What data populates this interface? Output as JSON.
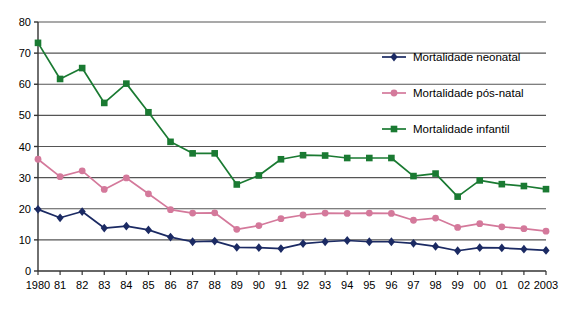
{
  "chart_data": {
    "type": "line",
    "title": "",
    "subtitle": "",
    "xlabel": "",
    "ylabel": "",
    "xlim": [
      1980,
      2003
    ],
    "ylim": [
      0,
      80
    ],
    "y_ticks": [
      0,
      10,
      20,
      30,
      40,
      50,
      60,
      70,
      80
    ],
    "grid": "horizontal",
    "legend_position": "top-right-inside",
    "x": [
      1980,
      1981,
      1982,
      1983,
      1984,
      1985,
      1986,
      1987,
      1988,
      1989,
      1990,
      1991,
      1992,
      1993,
      1994,
      1995,
      1996,
      1997,
      1998,
      1999,
      2000,
      2001,
      2002,
      2003
    ],
    "categories": [
      "1980",
      "81",
      "82",
      "83",
      "84",
      "85",
      "86",
      "87",
      "88",
      "89",
      "90",
      "91",
      "92",
      "93",
      "94",
      "95",
      "96",
      "97",
      "98",
      "99",
      "00",
      "01",
      "02",
      "2003"
    ],
    "series": [
      {
        "name": "Mortalidade neonatal",
        "color": "#1b2a63",
        "marker": "diamond",
        "values": [
          19.8,
          17.1,
          19.1,
          13.8,
          14.4,
          13.2,
          10.9,
          9.4,
          9.6,
          7.6,
          7.5,
          7.2,
          8.8,
          9.4,
          9.8,
          9.4,
          9.4,
          8.9,
          7.9,
          6.5,
          7.5,
          7.4,
          7.0,
          6.6
        ]
      },
      {
        "name": "Mortalidade pós-natal",
        "color": "#d4799b",
        "marker": "circle",
        "values": [
          35.9,
          30.3,
          32.2,
          26.2,
          29.9,
          24.8,
          19.7,
          18.6,
          18.7,
          13.4,
          14.6,
          16.8,
          18.0,
          18.6,
          18.5,
          18.6,
          18.5,
          16.3,
          17.0,
          14.0,
          15.2,
          14.2,
          13.6,
          12.8
        ]
      },
      {
        "name": "Mortalidade infantil",
        "color": "#1a7a32",
        "marker": "square",
        "values": [
          73.3,
          61.7,
          65.2,
          54.0,
          60.2,
          51.0,
          41.5,
          37.8,
          37.8,
          27.8,
          30.7,
          35.9,
          37.2,
          37.1,
          36.3,
          36.3,
          36.3,
          30.5,
          31.3,
          23.9,
          29.1,
          27.9,
          27.3,
          26.3
        ]
      }
    ]
  },
  "axes": {
    "y_tick_labels": [
      "80",
      "70",
      "60",
      "50",
      "40",
      "30",
      "20",
      "10",
      "0"
    ],
    "x_tick_labels": [
      "1980",
      "81",
      "82",
      "83",
      "84",
      "85",
      "86",
      "87",
      "88",
      "89",
      "90",
      "91",
      "92",
      "93",
      "94",
      "95",
      "96",
      "97",
      "98",
      "99",
      "00",
      "01",
      "02",
      "2003"
    ]
  },
  "legend": {
    "items": [
      {
        "label": "Mortalidade neonatal",
        "color": "#1b2a63",
        "marker": "diamond"
      },
      {
        "label": "Mortalidade pós-natal",
        "color": "#d4799b",
        "marker": "circle"
      },
      {
        "label": "Mortalidade infantil",
        "color": "#1a7a32",
        "marker": "square"
      }
    ]
  },
  "style": {
    "plot_background": "#ffffff",
    "axis_color": "#333333",
    "gridline_color": "#555555"
  }
}
